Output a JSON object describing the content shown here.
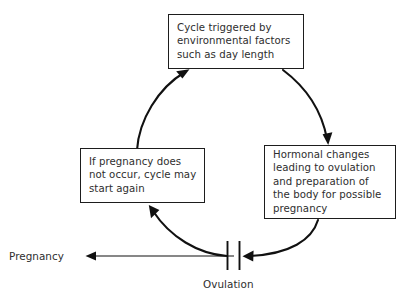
{
  "diagram": {
    "background_color": "#ffffff",
    "line_color": "#111111",
    "text_color": "#2e2e2e",
    "boxes": [
      {
        "id": "cycle-trigger",
        "text": "Cycle triggered by\nenvironmental factors\nsuch as day length"
      },
      {
        "id": "hormonal-changes",
        "text": "Hormonal changes\nleading to ovulation\nand preparation of\nthe body for possible\npregnancy"
      },
      {
        "id": "no-pregnancy",
        "text": "If pregnancy does\nnot occur, cycle may\nstart again"
      }
    ],
    "labels": {
      "pregnancy": "Pregnancy",
      "ovulation": "Ovulation"
    },
    "connectors": [
      {
        "id": "left-to-top",
        "from": "no-pregnancy",
        "to": "cycle-trigger",
        "style": "curved-arrow"
      },
      {
        "id": "top-to-right",
        "from": "cycle-trigger",
        "to": "hormonal-changes",
        "style": "curved-arrow"
      },
      {
        "id": "right-to-bottom",
        "from": "hormonal-changes",
        "to": "ovulation",
        "style": "curved-arrow"
      },
      {
        "id": "bottom-to-left",
        "from": "ovulation",
        "to": "no-pregnancy",
        "style": "curved-arrow"
      },
      {
        "id": "ovulation-to-pregnancy",
        "from": "ovulation",
        "to": "pregnancy",
        "style": "straight-arrow"
      }
    ]
  }
}
